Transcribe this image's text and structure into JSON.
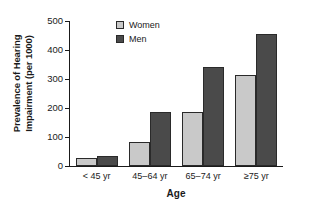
{
  "chart_data": {
    "type": "bar",
    "title": "",
    "xlabel": "Age",
    "ylabel": "Prevalence of Hearing Impairment (per 1000)",
    "ylabel_lines": [
      "Prevalence of Hearing",
      "Impairment (per 1000)"
    ],
    "categories": [
      "< 45 yr",
      "45–64 yr",
      "65–74 yr",
      "≥75 yr"
    ],
    "series": [
      {
        "name": "Women",
        "values": [
          28,
          82,
          185,
          315
        ],
        "color": "#c9c9c9"
      },
      {
        "name": "Men",
        "values": [
          35,
          185,
          340,
          455
        ],
        "color": "#4a4a4a"
      }
    ],
    "ylim": [
      0,
      500
    ],
    "yticks": [
      0,
      100,
      200,
      300,
      400,
      500
    ],
    "ytick_labels": [
      "0",
      "100",
      "200",
      "300",
      "400",
      "500"
    ],
    "grid": false,
    "legend_position": "top-left-inside"
  },
  "legend": {
    "items": [
      {
        "label": "Women"
      },
      {
        "label": "Men"
      }
    ]
  }
}
